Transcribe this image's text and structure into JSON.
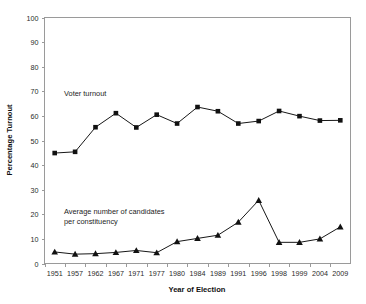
{
  "chart_data": {
    "type": "line",
    "title": "",
    "subtitle": "",
    "xlabel": "Year of Election",
    "ylabel": "Percentage Turnout",
    "x": [
      "1951",
      "1957",
      "1962",
      "1967",
      "1971",
      "1977",
      "1980",
      "1984",
      "1989",
      "1991",
      "1996",
      "1998",
      "1999",
      "2004",
      "2009"
    ],
    "categories": [
      "1951",
      "1957",
      "1962",
      "1967",
      "1971",
      "1977",
      "1980",
      "1984",
      "1989",
      "1991",
      "1996",
      "1998",
      "1999",
      "2004",
      "2009"
    ],
    "ylim": [
      0,
      100
    ],
    "ytick_step": 10,
    "yticks": [
      "100",
      "90",
      "80",
      "70",
      "60",
      "50",
      "40",
      "30",
      "20",
      "10",
      "0"
    ],
    "grid": false,
    "legend": "inline-annotations",
    "series": [
      {
        "name": "Voter turnout",
        "marker": "square",
        "color": "#111111",
        "values": [
          44.9,
          45.4,
          55.4,
          61.1,
          55.3,
          60.5,
          56.9,
          63.6,
          61.9,
          56.9,
          57.9,
          62.0,
          59.9,
          58.1,
          58.2
        ]
      },
      {
        "name": "Average number of candidates per constituency",
        "marker": "triangle",
        "color": "#111111",
        "values": [
          4.7,
          3.8,
          4.0,
          4.5,
          5.3,
          4.4,
          8.9,
          10.2,
          11.5,
          16.8,
          25.7,
          8.6,
          8.6,
          10.0,
          14.9
        ]
      }
    ],
    "annotations": [
      {
        "id": "voter-turnout-label",
        "text": "Voter turnout",
        "x_px": 64,
        "y_px": 96
      },
      {
        "id": "candidates-label-line1",
        "text": "Average number of candidates",
        "x_px": 64,
        "y_px": 214
      },
      {
        "id": "candidates-label-line2",
        "text": "per constituency",
        "x_px": 64,
        "y_px": 224
      }
    ],
    "colors": {
      "axis": "#9a9a9a",
      "line": "#171717",
      "marker": "#111111",
      "text": "#1d1d1d",
      "background": "#ffffff"
    }
  }
}
